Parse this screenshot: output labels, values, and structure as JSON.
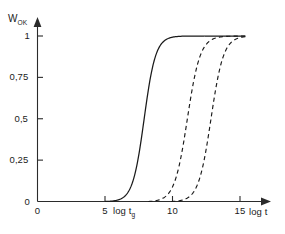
{
  "chart_data": {
    "type": "line",
    "title": "",
    "xlabel": "log t",
    "ylabel": "W_OK",
    "xlim": [
      0,
      15.8
    ],
    "ylim": [
      0,
      1.06
    ],
    "grid": false,
    "legend": "none",
    "x_ticks": [
      {
        "value": 0,
        "label": "0"
      },
      {
        "value": 5,
        "label": "5"
      },
      {
        "value": 10,
        "label": "10"
      },
      {
        "value": 15,
        "label": "15"
      }
    ],
    "y_ticks": [
      {
        "value": 0,
        "label": "0"
      },
      {
        "value": 0.25,
        "label": "0,25"
      },
      {
        "value": 0.5,
        "label": "0,5"
      },
      {
        "value": 0.75,
        "label": "0,75"
      },
      {
        "value": 1,
        "label": "1"
      }
    ],
    "annotations": [
      {
        "name": "log-tg-annotation",
        "text_main": "log t",
        "text_sub": "g",
        "x": 5.9,
        "y": -0.06
      }
    ],
    "series": [
      {
        "name": "curve-1-solid",
        "style": "solid",
        "color": "#1a1a1a",
        "midpoint_x": 7.9,
        "steepness": 2.35,
        "x": [
          5.0,
          5.6,
          6.1,
          6.5,
          6.9,
          7.2,
          7.45,
          7.7,
          7.9,
          8.1,
          8.3,
          8.55,
          8.8,
          9.1,
          9.5,
          10.0,
          11.0,
          12.5,
          14.0,
          15.4
        ],
        "y": [
          0.0,
          0.003,
          0.008,
          0.018,
          0.042,
          0.095,
          0.175,
          0.32,
          0.5,
          0.68,
          0.825,
          0.92,
          0.965,
          0.99,
          0.998,
          1.0,
          1.0,
          1.0,
          1.0,
          1.0
        ]
      },
      {
        "name": "curve-2-dashed",
        "style": "dashed",
        "color": "#1a1a1a",
        "midpoint_x": 11.1,
        "steepness": 2.1,
        "x": [
          8.2,
          8.8,
          9.3,
          9.7,
          10.05,
          10.35,
          10.6,
          10.85,
          11.1,
          11.3,
          11.55,
          11.8,
          12.05,
          12.35,
          12.75,
          13.3,
          14.2,
          15.4
        ],
        "y": [
          0.0,
          0.004,
          0.012,
          0.028,
          0.06,
          0.115,
          0.2,
          0.335,
          0.5,
          0.655,
          0.805,
          0.9,
          0.955,
          0.985,
          0.997,
          1.0,
          1.0,
          1.0
        ]
      },
      {
        "name": "curve-3-dashed",
        "style": "dashed",
        "color": "#1a1a1a",
        "midpoint_x": 12.85,
        "steepness": 2.15,
        "x": [
          9.9,
          10.5,
          11.0,
          11.45,
          11.8,
          12.1,
          12.35,
          12.6,
          12.85,
          13.05,
          13.3,
          13.55,
          13.8,
          14.1,
          14.5,
          15.0,
          15.4
        ],
        "y": [
          0.0,
          0.004,
          0.012,
          0.03,
          0.062,
          0.118,
          0.205,
          0.34,
          0.5,
          0.65,
          0.8,
          0.9,
          0.955,
          0.985,
          0.998,
          1.0,
          1.0
        ]
      }
    ]
  },
  "labels": {
    "y_axis_title_main": "W",
    "y_axis_title_sub": "OK",
    "x_axis_title": "log t",
    "x_origin": "0",
    "y_origin": "0",
    "tg_main": "log t",
    "tg_sub": "g"
  },
  "colors": {
    "axis": "#2b2b2b",
    "curve": "#1a1a1a",
    "background": "#ffffff"
  }
}
